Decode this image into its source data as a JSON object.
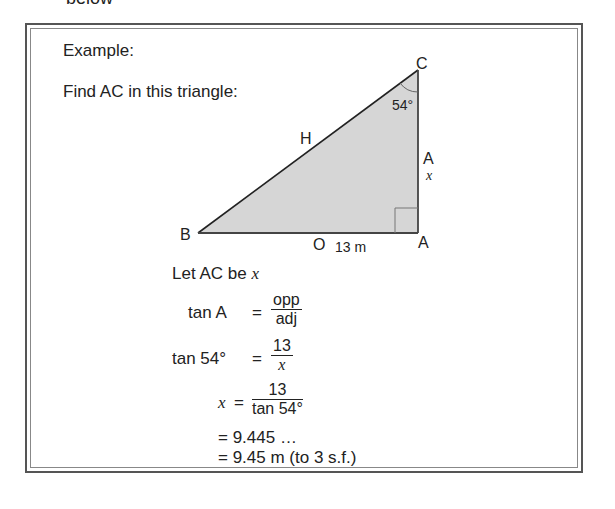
{
  "top_text": "below",
  "example": {
    "heading": "Example:",
    "prompt": "Find AC in this triangle:"
  },
  "triangle": {
    "vertices": {
      "B": "B",
      "A_bottom": "A",
      "C": "C"
    },
    "side_labels": {
      "hyp": "H",
      "opp": "O",
      "adj": "A"
    },
    "angle_label": "54°",
    "base_length": "13 m",
    "unknown": "x",
    "fill": "#d6d6d6"
  },
  "solution": {
    "let_line": "Let AC be",
    "let_var": "x",
    "line1_lhs": "tan A",
    "eq": "=",
    "line1_num": "opp",
    "line1_den": "adj",
    "line2_lhs": "tan 54°",
    "line2_num": "13",
    "line2_den": "x",
    "line3_lhs": "x",
    "line3_num": "13",
    "line3_den": "tan 54°",
    "line4": "= 9.445 …",
    "line5": "= 9.45 m (to 3 s.f.)"
  }
}
